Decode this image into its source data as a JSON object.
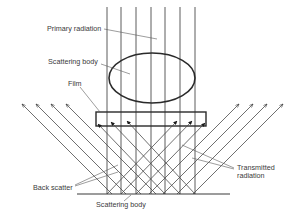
{
  "labels": {
    "primary_radiation": "Primary radiation",
    "scattering_body_top": "Scattering body",
    "film": "Film",
    "back_scatter": "Back scatter",
    "transmitted_line1": "Transmitted",
    "transmitted_line2": "radiation",
    "scattering_body_bottom": "Scattering body"
  },
  "geometry": {
    "beam_x": [
      107,
      121,
      136,
      151,
      165,
      180,
      195
    ],
    "beam_top_y": 7,
    "baseline_y": 194,
    "baseline_x": [
      77,
      230
    ],
    "ellipse": {
      "cx": 152,
      "cy": 78,
      "rx": 43,
      "ry": 25
    },
    "film": {
      "x": 96,
      "y": 112,
      "w": 110,
      "h": 14
    },
    "outer_arrow_y": 104
  },
  "colors": {
    "line": "#4a4a4a",
    "heavy": "#2a2a2a",
    "text": "#3a3a3a"
  }
}
